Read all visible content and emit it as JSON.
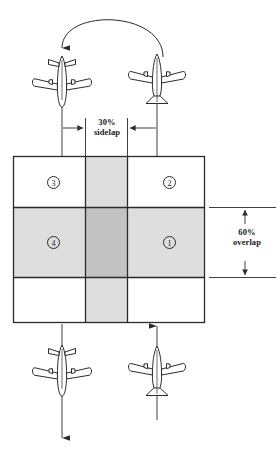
{
  "figure": {
    "labels": {
      "sidelap": "30%\nsidelap",
      "overlap": "60%\noverlap"
    },
    "colors": {
      "line": "#2b2b2b",
      "light_shade": "#dedede",
      "dark_shade": "#c2c2c2",
      "background": "#ffffff"
    },
    "grid": {
      "cells": [
        {
          "id": "cell-3",
          "label": "3",
          "x": 47,
          "y": 176
        },
        {
          "id": "cell-2",
          "label": "2",
          "x": 163,
          "y": 176
        },
        {
          "id": "cell-4",
          "label": "4",
          "x": 47,
          "y": 236
        },
        {
          "id": "cell-1",
          "label": "1",
          "x": 163,
          "y": 236
        }
      ]
    },
    "aircraft": [
      {
        "id": "aircraft-top-left",
        "heading": "down"
      },
      {
        "id": "aircraft-top-right",
        "heading": "up"
      },
      {
        "id": "aircraft-bottom-left",
        "heading": "down"
      },
      {
        "id": "aircraft-bottom-right",
        "heading": "up"
      }
    ]
  }
}
